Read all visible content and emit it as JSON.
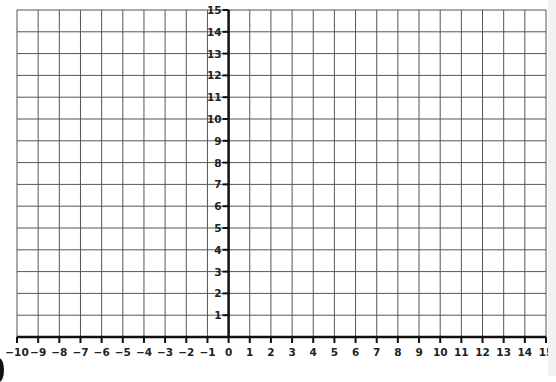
{
  "chart_data": {
    "type": "grid",
    "title": "",
    "xlabel": "",
    "ylabel": "",
    "xlim": [
      -10,
      15
    ],
    "ylim": [
      0,
      15
    ],
    "grid": true,
    "x_ticks": [
      -10,
      -9,
      -8,
      -7,
      -6,
      -5,
      -4,
      -3,
      -2,
      -1,
      0,
      1,
      2,
      3,
      4,
      5,
      6,
      7,
      8,
      9,
      10,
      11,
      12,
      13,
      14,
      15
    ],
    "x_tick_labels": [
      "−10",
      "−9",
      "−8",
      "−7",
      "−6",
      "−5",
      "−4",
      "−3",
      "−2",
      "−1",
      "0",
      "1",
      "2",
      "3",
      "4",
      "5",
      "6",
      "7",
      "8",
      "9",
      "10",
      "11",
      "12",
      "13",
      "14",
      "15"
    ],
    "y_ticks": [
      1,
      2,
      3,
      4,
      5,
      6,
      7,
      8,
      9,
      10,
      11,
      12,
      13,
      14,
      15
    ],
    "y_tick_labels": [
      "1",
      "2",
      "3",
      "4",
      "5",
      "6",
      "7",
      "8",
      "9",
      "10",
      "11",
      "12",
      "13",
      "14",
      "15"
    ],
    "series": [],
    "legend": null
  },
  "layout": {
    "plot_left": 17,
    "plot_right": 546,
    "plot_top": 10,
    "plot_bottom": 337,
    "grid_color": "#555555",
    "axis_color": "#111111"
  }
}
